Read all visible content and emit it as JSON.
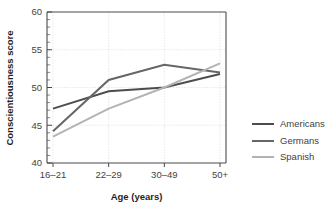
{
  "chart_data": {
    "type": "line",
    "title": "",
    "xlabel": "Age (years)",
    "ylabel": "Conscientiousness score",
    "categories": [
      "16–21",
      "22–29",
      "30–49",
      "50+"
    ],
    "ylim": [
      40,
      60
    ],
    "ytick_labels": [
      "40",
      "45",
      "50",
      "55",
      "60"
    ],
    "ytick_values": [
      40,
      45,
      50,
      55,
      60
    ],
    "yminor_step": 1,
    "grid": true,
    "grid_axis": "both",
    "legend_position": "right",
    "series": [
      {
        "name": "Americans",
        "values": [
          47.2,
          49.5,
          50.0,
          51.8
        ],
        "color": "#4d4d4d",
        "width": 2.0
      },
      {
        "name": "Germans",
        "values": [
          44.2,
          51.0,
          53.0,
          52.0
        ],
        "color": "#666666",
        "width": 2.0
      },
      {
        "name": "Spanish",
        "values": [
          43.5,
          47.2,
          50.0,
          53.2
        ],
        "color": "#b3b3b3",
        "width": 2.0
      }
    ]
  },
  "legend": {
    "entries": [
      {
        "label": "Americans"
      },
      {
        "label": "Germans"
      },
      {
        "label": "Spanish"
      }
    ]
  },
  "axes": {
    "x_title": "Age (years)",
    "y_title": "Conscientiousness score"
  }
}
